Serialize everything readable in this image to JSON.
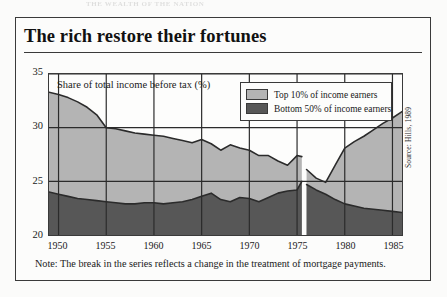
{
  "figure": {
    "title": "The rich restore their fortunes",
    "source": "Source: Hills, 1989",
    "note": "Note: The break in the series reflects a change in the treatment of mortgage payments.",
    "top_bleed_text": "THE WEALTH OF THE NATION"
  },
  "legend": {
    "position": "top-right-inside",
    "entries": [
      {
        "label": "Top 10% of income earners",
        "color": "#b4b4b4"
      },
      {
        "label": "Bottom 50% of income earners",
        "color": "#575757"
      }
    ]
  },
  "colors": {
    "top_band": "#b4b4b4",
    "bottom_band": "#575757",
    "line": "#2b2b2b",
    "frame": "#3a3a3a",
    "paper": "#fcfcfb"
  },
  "chart_data": {
    "type": "area",
    "title": "The rich restore their fortunes",
    "subtitle": "Share of total income before tax (%)",
    "xlabel": "",
    "ylabel": "Share of total income before tax (%)",
    "annotation": "Share of total income before tax (%)",
    "grid": true,
    "stacked": false,
    "xlim": [
      1949,
      1986
    ],
    "ylim": [
      20,
      35
    ],
    "yticks": [
      20,
      25,
      30,
      35
    ],
    "ytick_labels": [
      "20",
      "25",
      "30",
      "35"
    ],
    "xticks": [
      1950,
      1955,
      1960,
      1965,
      1970,
      1975,
      1980,
      1985
    ],
    "xtick_labels": [
      "1950",
      "1955",
      "1960",
      "1965",
      "1970",
      "1975",
      "1980",
      "1985"
    ],
    "series_break_at": 1975.5,
    "series": [
      {
        "name": "Top 10% of income earners",
        "color": "#b4b4b4",
        "x": [
          1949,
          1950,
          1951,
          1952,
          1953,
          1954,
          1955,
          1956,
          1957,
          1958,
          1959,
          1960,
          1961,
          1962,
          1963,
          1964,
          1965,
          1966,
          1967,
          1968,
          1969,
          1970,
          1971,
          1972,
          1973,
          1974,
          1975,
          1975.5,
          1976,
          1977,
          1978,
          1979,
          1980,
          1981,
          1982,
          1983,
          1984,
          1985,
          1986
        ],
        "values": [
          33.3,
          33.1,
          32.8,
          32.4,
          31.9,
          31.2,
          30.0,
          29.9,
          29.7,
          29.5,
          29.4,
          29.3,
          29.2,
          29.0,
          28.8,
          28.6,
          28.9,
          28.5,
          27.9,
          28.4,
          28.1,
          27.9,
          27.4,
          27.4,
          26.9,
          26.5,
          27.4,
          27.3,
          26.1,
          25.3,
          24.9,
          26.5,
          28.1,
          28.7,
          29.2,
          29.8,
          30.4,
          30.9,
          31.5
        ]
      },
      {
        "name": "Bottom 50% of income earners",
        "color": "#575757",
        "x": [
          1949,
          1950,
          1951,
          1952,
          1953,
          1954,
          1955,
          1956,
          1957,
          1958,
          1959,
          1960,
          1961,
          1962,
          1963,
          1964,
          1965,
          1966,
          1967,
          1968,
          1969,
          1970,
          1971,
          1972,
          1973,
          1974,
          1975,
          1975.5,
          1976,
          1977,
          1978,
          1979,
          1980,
          1981,
          1982,
          1983,
          1984,
          1985,
          1986
        ],
        "values": [
          24.0,
          23.8,
          23.6,
          23.4,
          23.3,
          23.2,
          23.1,
          23.0,
          22.9,
          22.9,
          23.0,
          23.0,
          22.9,
          23.0,
          23.1,
          23.3,
          23.6,
          23.9,
          23.3,
          23.1,
          23.5,
          23.4,
          23.1,
          23.5,
          23.9,
          24.1,
          24.2,
          25.0,
          24.7,
          24.2,
          23.8,
          23.3,
          22.9,
          22.7,
          22.5,
          22.4,
          22.3,
          22.2,
          22.1
        ]
      }
    ]
  }
}
